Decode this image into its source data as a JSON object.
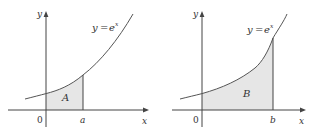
{
  "figure": {
    "panels": [
      {
        "id": "left",
        "curve_label_y": "y",
        "curve_label_eq": "=",
        "curve_label_base": "e",
        "curve_label_exp": "x",
        "region_label": "A",
        "origin_label": "0",
        "bound_label": "a",
        "x_axis_label": "x",
        "y_axis_label": "y"
      },
      {
        "id": "right",
        "curve_label_y": "y",
        "curve_label_eq": "=",
        "curve_label_base": "e",
        "curve_label_exp": "x",
        "region_label": "B",
        "origin_label": "0",
        "bound_label": "b",
        "x_axis_label": "x",
        "y_axis_label": "y"
      }
    ],
    "colors": {
      "axis": "#444444",
      "curve": "#555555",
      "shade": "#e6e6e6",
      "text": "#333333"
    }
  }
}
